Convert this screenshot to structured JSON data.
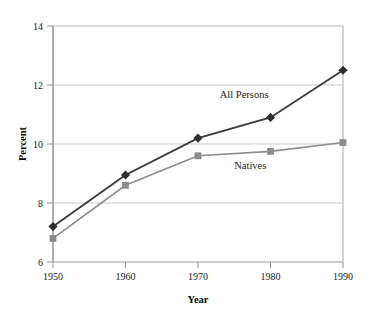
{
  "figure": {
    "cropped_caption_text": "",
    "background_color": "#ffffff"
  },
  "chart_data": {
    "type": "line",
    "title": "",
    "subtitle": "",
    "xlabel": "Year",
    "ylabel": "Percent",
    "x": [
      1950,
      1960,
      1970,
      1980,
      1990
    ],
    "xtick_labels": [
      "1950",
      "1960",
      "1970",
      "1980",
      "1990"
    ],
    "ytick_labels": [
      "6",
      "8",
      "10",
      "12",
      "14"
    ],
    "yticks": [
      6,
      8,
      10,
      12,
      14
    ],
    "xlim": [
      1950,
      1990
    ],
    "ylim": [
      6,
      14
    ],
    "grid": "horizontal",
    "legend": "inline-annotations",
    "series": [
      {
        "name": "All Persons",
        "label": "All Persons",
        "color": "#3b3b3b",
        "marker": "diamond",
        "values": [
          7.2,
          8.95,
          10.2,
          10.9,
          12.5
        ],
        "annotation": {
          "text": "All Persons",
          "x_year": 1973,
          "y_percent": 11.55
        }
      },
      {
        "name": "Natives",
        "label": "Natives",
        "color": "#8c8c8c",
        "marker": "square",
        "values": [
          6.8,
          8.6,
          9.6,
          9.75,
          10.05
        ],
        "annotation": {
          "text": "Natives",
          "x_year": 1975,
          "y_percent": 9.15
        }
      }
    ],
    "colors": {
      "all_persons": "#3b3b3b",
      "natives": "#8c8c8c",
      "axis": "#9a9a9a",
      "gridline": "#c9c9c9",
      "text": "#1a1a1a"
    }
  }
}
